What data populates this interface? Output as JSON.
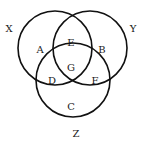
{
  "diagram": {
    "type": "venn-3-set",
    "stroke_color": "#111111",
    "background": "#ffffff",
    "sets": [
      {
        "id": "X",
        "label": "X",
        "cx": 55,
        "cy": 48,
        "r": 37,
        "label_x": 9,
        "label_y": 29
      },
      {
        "id": "Y",
        "label": "Y",
        "cx": 90,
        "cy": 48,
        "r": 37,
        "label_x": 133,
        "label_y": 29
      },
      {
        "id": "Z",
        "label": "Z",
        "cx": 73,
        "cy": 80,
        "r": 37,
        "label_x": 76,
        "label_y": 134
      }
    ],
    "regions": [
      {
        "id": "A",
        "label": "A",
        "membership": "X only",
        "x": 40,
        "y": 50
      },
      {
        "id": "E",
        "label": "E",
        "membership": "X and Y only",
        "x": 71,
        "y": 43
      },
      {
        "id": "B",
        "label": "B",
        "membership": "Y only",
        "x": 102,
        "y": 50
      },
      {
        "id": "G",
        "label": "G",
        "membership": "X, Y and Z",
        "x": 71,
        "y": 68
      },
      {
        "id": "D",
        "label": "D",
        "membership": "X and Z only",
        "x": 52,
        "y": 81
      },
      {
        "id": "F",
        "label": "F",
        "membership": "Y and Z only",
        "x": 95,
        "y": 81
      },
      {
        "id": "C",
        "label": "C",
        "membership": "Z only",
        "x": 71,
        "y": 107
      }
    ]
  }
}
